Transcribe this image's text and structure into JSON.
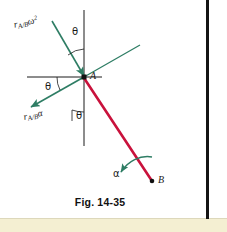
{
  "figure": {
    "caption": "Fig. 14-35",
    "points": [
      {
        "name": "point-a",
        "label": "A",
        "x": 84,
        "y": 77
      },
      {
        "name": "point-b",
        "label": "B",
        "x": 152,
        "y": 181
      }
    ],
    "vectors": [
      {
        "name": "r-ab-omega-squared",
        "label_main": "r",
        "label_sub": "A/B",
        "label_sup": "2",
        "label_omega": "ω",
        "color": "#2e7d64",
        "description": "normal acceleration component arrow pointing down-right into A"
      },
      {
        "name": "r-ab-alpha",
        "label_main": "r",
        "label_sub": "A/B",
        "label_alpha": "α",
        "color": "#2e7d64",
        "description": "tangential acceleration component arrow pointing down-left away from A"
      }
    ],
    "angles": [
      {
        "name": "theta-top",
        "label": "θ"
      },
      {
        "name": "theta-left",
        "label": "θ"
      },
      {
        "name": "theta-bottom",
        "label": "θ"
      }
    ],
    "rotation": {
      "name": "alpha-rotation",
      "label": "α",
      "color": "#2e7d64"
    },
    "link": {
      "name": "rigid-link-ab",
      "color": "#c9123c",
      "description": "red rigid link from A to B"
    },
    "axes": {
      "name": "reference-axes",
      "color": "#1a1a1a"
    }
  },
  "colors": {
    "green": "#2e7d64",
    "red": "#c9123c",
    "black": "#1a1a1a",
    "page_edge": "#141414",
    "bottom_strip": "#f4efd2"
  }
}
